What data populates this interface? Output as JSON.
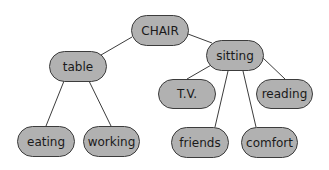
{
  "diagram": {
    "type": "concept-tree",
    "root": "CHAIR",
    "nodes": [
      {
        "id": "chair",
        "label": "CHAIR",
        "x": 131,
        "y": 15,
        "w": 58,
        "h": 31
      },
      {
        "id": "table",
        "label": "table",
        "x": 49,
        "y": 51,
        "w": 58,
        "h": 31
      },
      {
        "id": "sitting",
        "label": "sitting",
        "x": 206,
        "y": 40,
        "w": 58,
        "h": 31
      },
      {
        "id": "eating",
        "label": "eating",
        "x": 17,
        "y": 126,
        "w": 58,
        "h": 31
      },
      {
        "id": "working",
        "label": "working",
        "x": 83,
        "y": 126,
        "w": 57,
        "h": 31
      },
      {
        "id": "tv",
        "label": "T.V.",
        "x": 158,
        "y": 79,
        "w": 58,
        "h": 30
      },
      {
        "id": "reading",
        "label": "reading",
        "x": 256,
        "y": 79,
        "w": 57,
        "h": 30
      },
      {
        "id": "friends",
        "label": "friends",
        "x": 171,
        "y": 127,
        "w": 58,
        "h": 31
      },
      {
        "id": "comfort",
        "label": "comfort",
        "x": 241,
        "y": 127,
        "w": 57,
        "h": 31
      }
    ],
    "edges": [
      {
        "from": "chair",
        "to": "table",
        "x1": 132,
        "y1": 37,
        "x2": 101,
        "y2": 55
      },
      {
        "from": "chair",
        "to": "sitting",
        "x1": 188,
        "y1": 34,
        "x2": 212,
        "y2": 43
      },
      {
        "from": "table",
        "to": "eating",
        "x1": 64,
        "y1": 81,
        "x2": 46,
        "y2": 126
      },
      {
        "from": "table",
        "to": "working",
        "x1": 89,
        "y1": 81,
        "x2": 111,
        "y2": 126
      },
      {
        "from": "sitting",
        "to": "tv",
        "x1": 213,
        "y1": 64,
        "x2": 187,
        "y2": 79
      },
      {
        "from": "sitting",
        "to": "reading",
        "x1": 263,
        "y1": 58,
        "x2": 285,
        "y2": 79
      },
      {
        "from": "sitting",
        "to": "friends",
        "x1": 228,
        "y1": 71,
        "x2": 215,
        "y2": 127
      },
      {
        "from": "sitting",
        "to": "comfort",
        "x1": 243,
        "y1": 71,
        "x2": 256,
        "y2": 127
      }
    ]
  },
  "colors": {
    "node_fill": "#b1b1b1",
    "node_border": "#3c3c3c",
    "edge": "#3c3c3c"
  }
}
